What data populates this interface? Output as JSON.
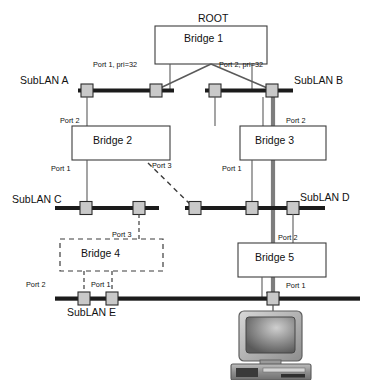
{
  "diagram": {
    "title_root": "ROOT",
    "bridges": [
      {
        "id": "bridge1",
        "label": "Bridge 1"
      },
      {
        "id": "bridge2",
        "label": "Bridge 2"
      },
      {
        "id": "bridge3",
        "label": "Bridge 3"
      },
      {
        "id": "bridge4",
        "label": "Bridge 4"
      },
      {
        "id": "bridge5",
        "label": "Bridge 5"
      }
    ],
    "sublans": [
      {
        "id": "sublanA",
        "label": "SubLAN A"
      },
      {
        "id": "sublanB",
        "label": "SubLAN B"
      },
      {
        "id": "sublanC",
        "label": "SubLAN C"
      },
      {
        "id": "sublanD",
        "label": "SubLAN D"
      },
      {
        "id": "sublanE",
        "label": "SubLAN E"
      }
    ],
    "port_labels": {
      "b1_p1": "Port 1, pri=32",
      "b1_p2": "Port 2, pri=32",
      "b2_p2": "Port 2",
      "b2_p1": "Port 1",
      "b2_p3": "Port 3",
      "b3_p2": "Port 2",
      "b3_p1": "Port 1",
      "b4_p3": "Port 3",
      "b4_p2": "Port 2",
      "b4_p1": "Port 1",
      "b5_p2": "Port 2",
      "b5_p1": "Port 1"
    },
    "colors": {
      "bus": "#1b1b1b",
      "connector_fill": "#c9c9c9",
      "connector_stroke": "#2b2b2b",
      "line": "#5a5a5a",
      "box_stroke": "#3c3c3c",
      "highlight_path": "#7d7d7d",
      "dashed": "#3c3c3c",
      "text": "#111111",
      "monitor_body": "#b9b9b9",
      "monitor_screen": "#6e6e6e",
      "case_body": "#9c9c9c"
    }
  }
}
